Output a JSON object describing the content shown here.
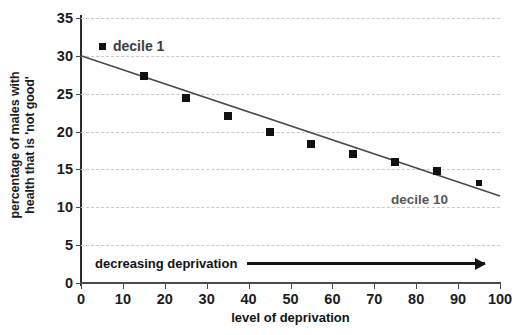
{
  "chart_data": {
    "type": "scatter",
    "title": "",
    "xlabel": "level of deprivation",
    "ylabel_line1": "percentage of males with",
    "ylabel_line2": "health that is 'not good'",
    "xlim": [
      0,
      100
    ],
    "ylim": [
      0,
      35
    ],
    "xticks": [
      0,
      10,
      20,
      30,
      40,
      50,
      60,
      70,
      80,
      90,
      100
    ],
    "yticks": [
      0,
      5,
      10,
      15,
      20,
      25,
      30,
      35
    ],
    "grid": "horizontal-dashed",
    "legend_position": "inside-top-left",
    "x": [
      15,
      25,
      35,
      45,
      55,
      65,
      75,
      85,
      95
    ],
    "values": [
      27.3,
      24.4,
      22.0,
      20.0,
      18.4,
      17.1,
      16.0,
      14.8,
      13.2
    ],
    "series": [
      {
        "name": "decile 1",
        "x": [
          15,
          25,
          35,
          45,
          55,
          65,
          75,
          85,
          95
        ],
        "values": [
          27.3,
          24.4,
          22.0,
          20.0,
          18.4,
          17.1,
          16.0,
          14.8,
          13.2
        ],
        "marker": "filled-square",
        "color": "#111111"
      }
    ],
    "trendline": {
      "type": "line",
      "x": [
        0,
        100
      ],
      "values": [
        30.0,
        11.5
      ],
      "color": "#4a4a4a"
    },
    "annotations": [
      {
        "text": "decile 1",
        "role": "legend-entry",
        "x": 8,
        "y": 31.5
      },
      {
        "text": "decile 10",
        "role": "series-end-label",
        "x": 80,
        "y": 11.5
      },
      {
        "text": "decreasing deprivation",
        "role": "arrow-caption",
        "x": 3,
        "y": 3.3
      }
    ]
  },
  "legend": {
    "entries": [
      {
        "label": "decile 1",
        "color": "#111111"
      }
    ]
  },
  "labels": {
    "decile10": "decile 10",
    "arrow_caption": "decreasing deprivation",
    "xtitle": "level of deprivation",
    "ytitle_line1": "percentage of males with",
    "ytitle_line2": "health that is 'not good'"
  },
  "axis": {
    "y_tick_labels": [
      "0",
      "5",
      "10",
      "15",
      "20",
      "25",
      "30",
      "35"
    ],
    "x_tick_labels": [
      "0",
      "10",
      "20",
      "30",
      "40",
      "50",
      "60",
      "70",
      "80",
      "90",
      "100"
    ]
  },
  "colors": {
    "marker": "#111111",
    "trendline": "#4a4a4a",
    "gridline": "#c9c9cf",
    "axis": "#2b2b2b",
    "text": "#1b1b1b",
    "muted_text": "#585858",
    "background": "#ffffff"
  }
}
